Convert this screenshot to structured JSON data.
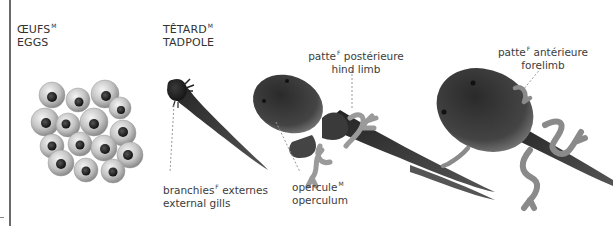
{
  "stages": [
    {
      "id": "eggs",
      "title_fr": "ŒUFS",
      "title_fr_gender": "M",
      "title_en": "EGGS"
    },
    {
      "id": "tadpole",
      "title_fr": "TÊTARD",
      "title_fr_gender": "M",
      "title_en": "TADPOLE"
    }
  ],
  "labels": {
    "external_gills": {
      "fr": "branchies",
      "fr_gender": "F",
      "fr_suffix": " externes",
      "en": "external gills"
    },
    "operculum": {
      "fr": "opercule",
      "fr_gender": "M",
      "en": "operculum"
    },
    "hind_limb": {
      "fr": "patte",
      "fr_gender": "F",
      "fr_suffix": " postérieure",
      "en": "hind limb"
    },
    "forelimb": {
      "fr": "patte",
      "fr_gender": "F",
      "fr_suffix": " antérieure",
      "en": "forelimb"
    }
  },
  "colors": {
    "background": "#ffffff",
    "text": "#3a3a3a",
    "border": "#6a6a6a",
    "egg_shell": "#c8c8c8",
    "egg_core": "#1a1a1a",
    "tadpole_dark": "#1c1c1c",
    "limb_gray": "#9a9a9a"
  }
}
